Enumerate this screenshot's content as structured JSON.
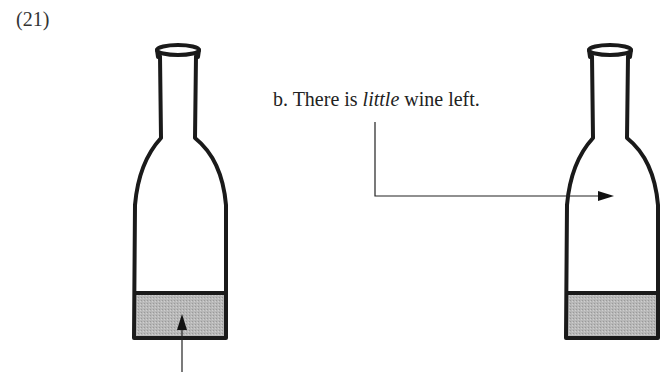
{
  "example_number": "(21)",
  "caption": {
    "prefix": "b.  There is ",
    "emphasis": "little",
    "suffix": " wine left."
  },
  "figure": {
    "bottles": [
      {
        "id": "left",
        "fill_level": "low",
        "liquid_color": "#b4b4b4"
      },
      {
        "id": "right",
        "fill_level": "low",
        "liquid_color": "#b4b4b4"
      }
    ],
    "arrows": [
      {
        "id": "up-arrow-left",
        "target": "left bottle liquid"
      },
      {
        "id": "caption-arrow-right",
        "target": "right bottle empty space"
      }
    ],
    "colors": {
      "outline": "#1a1a1a",
      "liquid": "#b4b4b4",
      "arrow": "#222222"
    }
  }
}
